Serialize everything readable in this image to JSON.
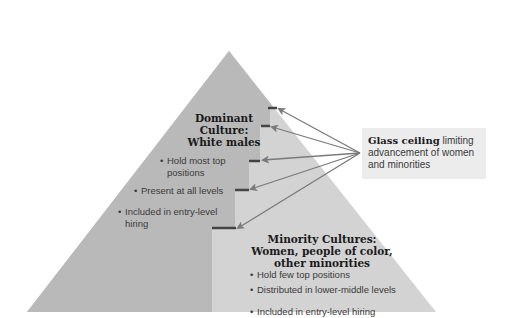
{
  "diagram": {
    "type": "pyramid",
    "colors": {
      "background": "#ffffff",
      "dominant_region": "#b8b8b8",
      "minority_region": "#d2d2d2",
      "tick_marks": "#444444",
      "arrows": "#7a7a7a",
      "callout_bg": "#ececec"
    },
    "dominant": {
      "heading_line1": "Dominant",
      "heading_line2": "Culture:",
      "heading_line3": "White males",
      "bullets": [
        "Hold most top positions",
        "Present at all levels",
        "Included in entry-level hiring"
      ]
    },
    "minority": {
      "heading_line1": "Minority Cultures:",
      "heading_line2": "Women, people of color,",
      "heading_line3": "other minorities",
      "bullets": [
        "Hold few top positions",
        "Distributed in lower-middle levels",
        "Included in entry-level hiring"
      ]
    },
    "callout": {
      "title": "Glass ceiling",
      "text": " limiting advancement of women and minorities"
    },
    "arrow_count": 5
  }
}
